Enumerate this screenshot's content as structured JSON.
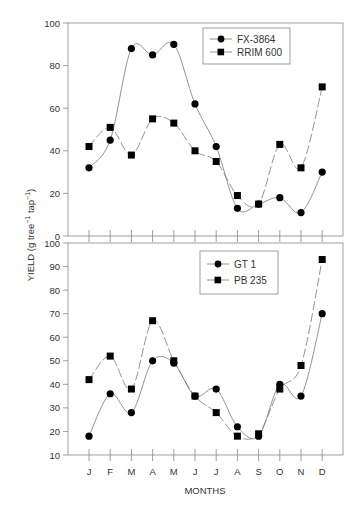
{
  "chart_data": [
    {
      "type": "line",
      "panel": "top",
      "title": "",
      "xlabel": "",
      "ylabel": "YIELD (g tree-1 tap-1)",
      "ylim": [
        0,
        100
      ],
      "yticks": [
        0,
        20,
        40,
        60,
        80,
        100
      ],
      "categories": [
        "J",
        "F",
        "M",
        "A",
        "M",
        "J",
        "J",
        "A",
        "S",
        "O",
        "N",
        "D"
      ],
      "legend_position": "upper center-right",
      "grid": false,
      "series": [
        {
          "name": "FX-3864",
          "marker": "circle",
          "line": "solid",
          "values": [
            32,
            45,
            88,
            85,
            90,
            62,
            42,
            13,
            15,
            18,
            11,
            30
          ]
        },
        {
          "name": "RRIM 600",
          "marker": "square",
          "line": "dashed",
          "values": [
            42,
            51,
            38,
            55,
            53,
            40,
            35,
            19,
            15,
            43,
            32,
            70
          ]
        }
      ]
    },
    {
      "type": "line",
      "panel": "bottom",
      "title": "",
      "xlabel": "MONTHS",
      "ylabel": "YIELD (g tree-1 tap-1)",
      "ylim": [
        10,
        100
      ],
      "yticks": [
        10,
        20,
        30,
        40,
        50,
        60,
        70,
        80,
        90,
        100
      ],
      "categories": [
        "J",
        "F",
        "M",
        "A",
        "M",
        "J",
        "J",
        "A",
        "S",
        "O",
        "N",
        "D"
      ],
      "legend_position": "upper center",
      "grid": false,
      "series": [
        {
          "name": "GT 1",
          "marker": "circle",
          "line": "solid",
          "values": [
            18,
            36,
            28,
            50,
            49,
            35,
            38,
            22,
            18,
            40,
            35,
            70
          ]
        },
        {
          "name": "PB 235",
          "marker": "square",
          "line": "dashed",
          "values": [
            42,
            52,
            38,
            67,
            50,
            35,
            28,
            18,
            19,
            38,
            48,
            93
          ]
        }
      ]
    }
  ],
  "labels": {
    "y_axis_title": "YIELD (g tree",
    "y_axis_sup1": "−1",
    "y_axis_mid": " tap",
    "y_axis_sup2": "−1",
    "y_axis_end": ")",
    "x_axis_title": "MONTHS"
  },
  "colors": {
    "line": "#777777",
    "marker": "#000000",
    "axis": "#888888",
    "text": "#333333"
  }
}
